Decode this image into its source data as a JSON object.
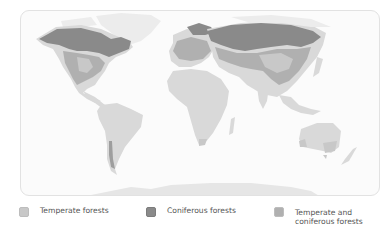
{
  "map": {
    "type": "world-forest-distribution",
    "colors": {
      "ocean": "#fbfbfb",
      "land": "#d9d9d9",
      "ice": "#ececec",
      "temperate": "#c8c8c8",
      "coniferous": "#8a8a8a",
      "mixed": "#b0b0b0",
      "frame_border": "#e2e2e2"
    }
  },
  "legend": {
    "items": [
      {
        "id": "temperate",
        "label": "Temperate forests",
        "color": "#c8c8c8"
      },
      {
        "id": "coniferous",
        "label": "Coniferous forests",
        "color": "#8a8a8a"
      },
      {
        "id": "mixed",
        "label": "Temperate and\nconiferous forests",
        "color": "#b0b0b0"
      }
    ]
  }
}
